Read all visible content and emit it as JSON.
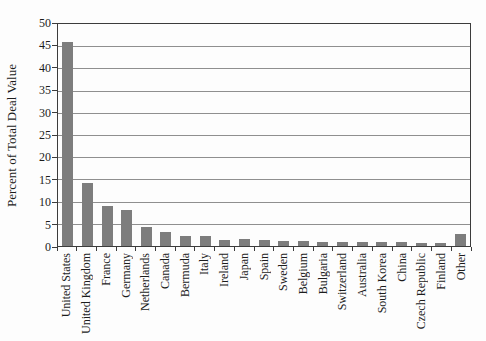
{
  "chart_data": {
    "type": "bar",
    "title": "",
    "xlabel": "",
    "ylabel": "Percent of Total Deal Value",
    "ylim": [
      0,
      50
    ],
    "y_ticks": [
      0,
      5,
      10,
      15,
      20,
      25,
      30,
      35,
      40,
      45,
      50
    ],
    "grid": "horizontal",
    "legend": "none",
    "bar_color": "#7d7d7d",
    "categories": [
      "United States",
      "United Kingdom",
      "France",
      "Germany",
      "Netherlands",
      "Canada",
      "Bermuda",
      "Italy",
      "Ireland",
      "Japan",
      "Spain",
      "Sweden",
      "Belgium",
      "Bulgaria",
      "Switzerland",
      "Australia",
      "South Korea",
      "China",
      "Czech Republic",
      "Finland",
      "Other"
    ],
    "values": [
      46,
      14.3,
      9.1,
      8.0,
      4.3,
      3.2,
      2.2,
      2.2,
      1.4,
      1.6,
      1.4,
      1.1,
      1.2,
      1.0,
      1.0,
      0.9,
      0.9,
      0.8,
      0.7,
      0.6,
      2.7
    ]
  }
}
